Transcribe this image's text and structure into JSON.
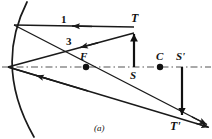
{
  "figure": {
    "caption": "(a)",
    "type": "concave-mirror-ray-diagram",
    "colors": {
      "ink": "#1a1a1a",
      "background": "#ffffff",
      "axis": "#555555"
    },
    "labels": {
      "object_top": "T",
      "image_top": "T'",
      "object_base": "S",
      "image_base": "S'",
      "center_of_curvature": "C",
      "focal_point": "F",
      "ray_one": "1",
      "ray_three": "3"
    },
    "points": {
      "vertex": [
        7,
        67
      ],
      "focal_point": [
        86,
        67
      ],
      "center_of_curvature": [
        160,
        67
      ],
      "object_base_S": [
        134,
        67
      ],
      "object_top_T": [
        134,
        30
      ],
      "image_base_Sprime": [
        182,
        67
      ],
      "image_top_Tprime": [
        182,
        118
      ]
    },
    "geometry": {
      "mirror_arc": {
        "start": [
          27,
          2
        ],
        "end": [
          34,
          137
        ],
        "vertex": [
          7,
          67
        ]
      },
      "optical_axis": {
        "from": [
          2,
          67
        ],
        "to": [
          212,
          67
        ],
        "style": "dash-dot"
      },
      "ray_1": {
        "description": "parallel ray from T to mirror, reflects through F",
        "incident": [
          [
            134,
            30
          ],
          [
            13,
            25
          ]
        ],
        "arrow_at": [
          78,
          27
        ],
        "arrow_direction": "left",
        "reflected": [
          [
            13,
            25
          ],
          [
            205,
            124
          ]
        ]
      },
      "ray_3": {
        "description": "ray from T through F to mirror, reflects parallel",
        "incident": [
          [
            134,
            33
          ],
          [
            7,
            67
          ]
        ],
        "arrow_at": [
          80,
          43
        ],
        "arrow_direction": "left",
        "reflected": [
          [
            7,
            67
          ],
          [
            207,
            127
          ]
        ]
      },
      "object_arrow": {
        "from": [
          134,
          67
        ],
        "to": [
          134,
          31
        ],
        "direction": "up"
      },
      "image_arrow": {
        "from": [
          182,
          67
        ],
        "to": [
          182,
          119
        ],
        "direction": "down"
      }
    }
  }
}
